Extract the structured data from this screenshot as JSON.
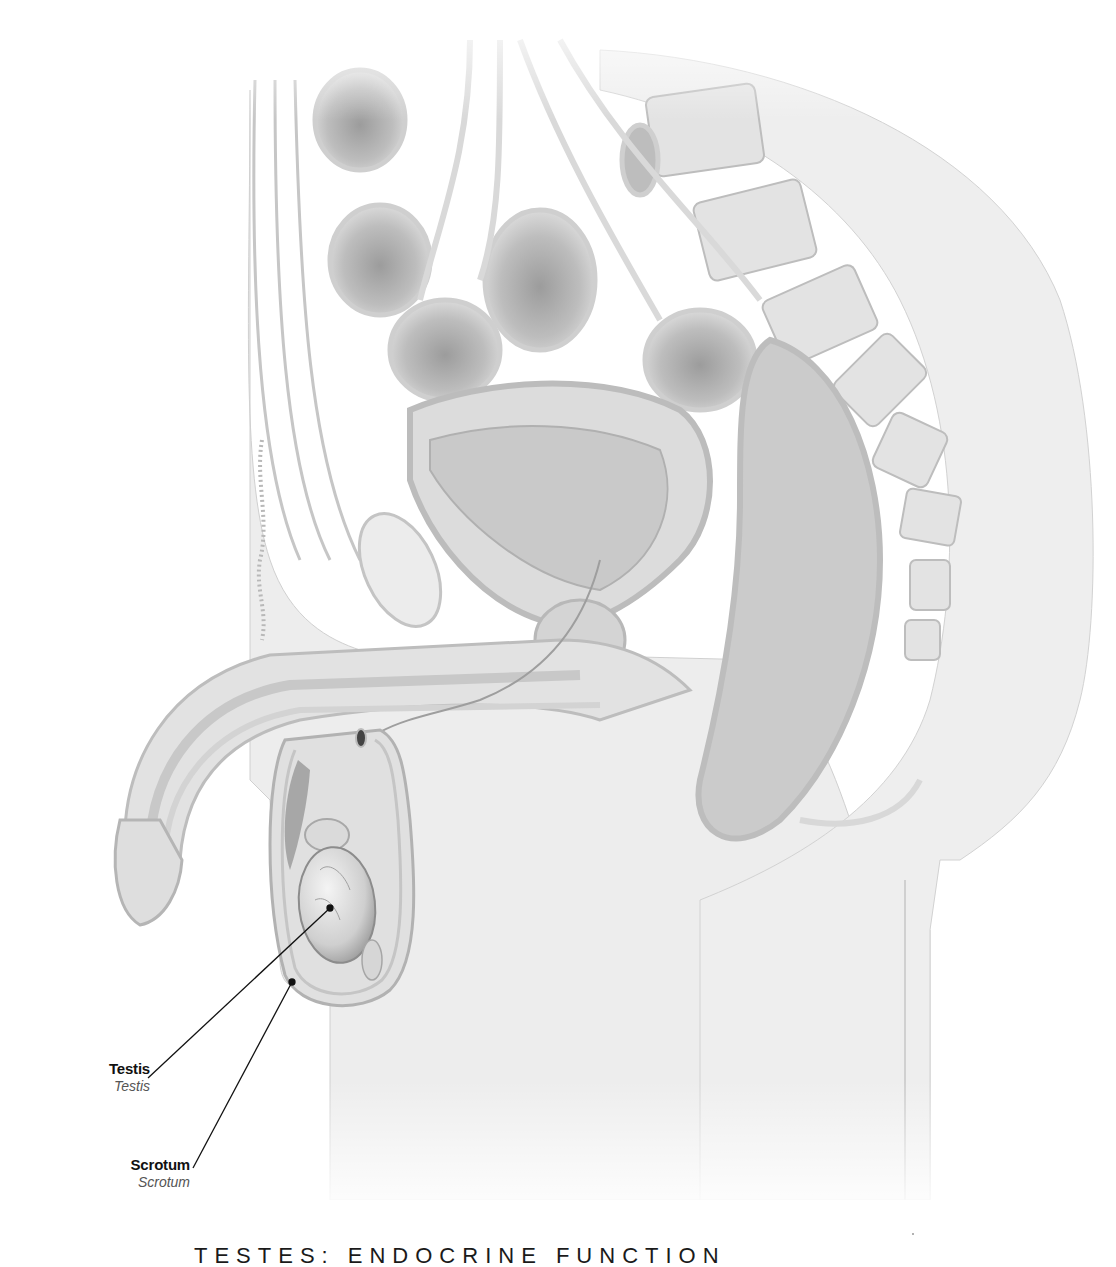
{
  "figure": {
    "style_colors": {
      "background": "#ffffff",
      "tissue_light": "#ececec",
      "tissue_mid": "#d6d6d6",
      "tissue_dark": "#a8a8a8",
      "outline": "#8a8a8a",
      "leader_line": "#111111"
    }
  },
  "labels": [
    {
      "id": "testis",
      "term": "Testis",
      "latin": "Testis",
      "anchor": [
        330,
        908
      ]
    },
    {
      "id": "scrotum",
      "term": "Scrotum",
      "latin": "Scrotum",
      "anchor": [
        292,
        982
      ]
    }
  ],
  "page": {
    "title": "TESTES: ENDOCRINE FUNCTION"
  }
}
